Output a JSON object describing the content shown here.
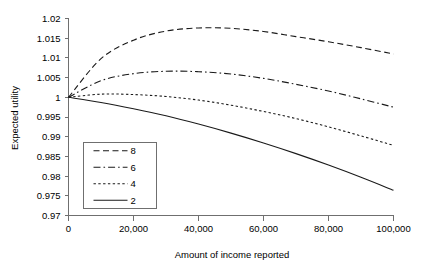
{
  "chart_data": {
    "type": "line",
    "title": "",
    "xlabel": "Amount of income reported",
    "ylabel": "Expected utility",
    "xlim": [
      0,
      100000
    ],
    "ylim": [
      0.97,
      1.02
    ],
    "grid": false,
    "legend_position": "lower-left-inside",
    "xticks": [
      0,
      20000,
      40000,
      60000,
      80000,
      100000
    ],
    "xticklabels": [
      "0",
      "20,000",
      "40,000",
      "60,000",
      "80,000",
      "100,000"
    ],
    "yticks": [
      0.97,
      0.975,
      0.98,
      0.985,
      0.99,
      0.995,
      1,
      1.005,
      1.01,
      1.015,
      1.02
    ],
    "yticklabels": [
      "0.97",
      "0.975",
      "0.98",
      "0.985",
      "0.99",
      "0.995",
      "1",
      "1.005",
      "1.01",
      "1.015",
      "1.02"
    ],
    "x": [
      0,
      10000,
      20000,
      30000,
      40000,
      50000,
      60000,
      70000,
      80000,
      90000,
      100000
    ],
    "series": [
      {
        "name": "8",
        "label": "8",
        "linestyle": "dashed",
        "dasharray": "6,3.5",
        "color": "#1a1a1a",
        "values": [
          1.0,
          1.0098,
          1.0145,
          1.0168,
          1.0176,
          1.0175,
          1.0167,
          1.0154,
          1.0141,
          1.0126,
          1.011
        ]
      },
      {
        "name": "6",
        "label": "6",
        "linestyle": "dash-dot",
        "dasharray": "7,3,1.6,3",
        "color": "#1a1a1a",
        "values": [
          1.0,
          1.0042,
          1.006,
          1.0066,
          1.0065,
          1.0059,
          1.0048,
          1.0033,
          1.0016,
          0.9996,
          0.9975
        ]
      },
      {
        "name": "4",
        "label": "4",
        "linestyle": "dotted",
        "dasharray": "2.4,2.4",
        "color": "#1a1a1a",
        "values": [
          1.0,
          1.0008,
          1.0007,
          1.0002,
          0.9993,
          0.998,
          0.9964,
          0.9946,
          0.9925,
          0.9902,
          0.9878
        ]
      },
      {
        "name": "2",
        "label": "2",
        "linestyle": "solid",
        "dasharray": "",
        "color": "#1a1a1a",
        "values": [
          1.0,
          0.9987,
          0.9971,
          0.9953,
          0.9932,
          0.9909,
          0.9884,
          0.9857,
          0.9828,
          0.9797,
          0.9764
        ]
      }
    ]
  }
}
